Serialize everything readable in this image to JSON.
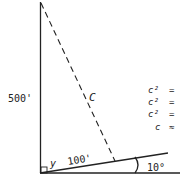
{
  "diagram": {
    "vertical_side_label": "500'",
    "hypotenuse_label": "C",
    "slope_side_label": "100'",
    "angle_vertex_label": "y",
    "incline_angle_label": "10°",
    "equations": [
      {
        "lhs": "c²",
        "op": "="
      },
      {
        "lhs": "c²",
        "op": "="
      },
      {
        "lhs": "c²",
        "op": "="
      },
      {
        "lhs": "c",
        "op": "≈"
      }
    ],
    "colors": {
      "line": "#222222",
      "background": "#ffffff"
    }
  }
}
